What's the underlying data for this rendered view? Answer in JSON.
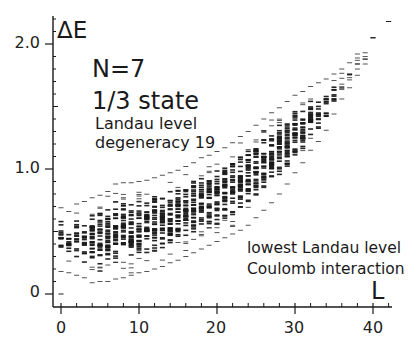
{
  "chart_data": {
    "type": "scatter",
    "title": "N=7 1/3 state",
    "subtitle": "Landau level degeneracy 19",
    "annotations": [
      "N=7",
      "1/3 state",
      "Landau level",
      "degeneracy 19",
      "lowest Landau level",
      "Coulomb interaction"
    ],
    "xlabel": "L",
    "ylabel": "ΔE",
    "xlim": [
      -1,
      42.5
    ],
    "ylim": [
      -0.1,
      2.2
    ],
    "x_ticks": [
      0,
      10,
      20,
      30,
      40
    ],
    "x_tick_labels": [
      "0",
      "10",
      "20",
      "30",
      "40"
    ],
    "y_ticks": [
      0,
      1.0,
      2.0
    ],
    "y_tick_labels": [
      "0",
      "1.0",
      "2.0"
    ],
    "y_minor_step": 0.1,
    "x_minor_step": 2,
    "grid": false,
    "legend": null,
    "marker": "short horizontal dash (energy level)",
    "series": [
      {
        "name": "energy spectrum envelope",
        "points": [
          {
            "L": 0,
            "ground": 0.0,
            "min": 0.18,
            "max": 0.69
          },
          {
            "L": 1,
            "min": 0.17,
            "max": 0.66
          },
          {
            "L": 2,
            "min": 0.15,
            "max": 0.72
          },
          {
            "L": 3,
            "min": 0.13,
            "max": 0.74
          },
          {
            "L": 4,
            "min": 0.09,
            "max": 0.77
          },
          {
            "L": 5,
            "min": 0.1,
            "max": 0.79
          },
          {
            "L": 6,
            "min": 0.1,
            "max": 0.82
          },
          {
            "L": 7,
            "min": 0.12,
            "max": 0.88
          },
          {
            "L": 8,
            "min": 0.13,
            "max": 0.89
          },
          {
            "L": 9,
            "min": 0.15,
            "max": 0.89
          },
          {
            "L": 10,
            "min": 0.17,
            "max": 0.9
          },
          {
            "L": 11,
            "min": 0.18,
            "max": 0.91
          },
          {
            "L": 12,
            "min": 0.2,
            "max": 0.93
          },
          {
            "L": 13,
            "min": 0.22,
            "max": 0.95
          },
          {
            "L": 14,
            "min": 0.25,
            "max": 0.97
          },
          {
            "L": 15,
            "min": 0.27,
            "max": 0.99
          },
          {
            "L": 16,
            "min": 0.3,
            "max": 1.02
          },
          {
            "L": 17,
            "min": 0.33,
            "max": 1.05
          },
          {
            "L": 18,
            "min": 0.36,
            "max": 1.09
          },
          {
            "L": 19,
            "min": 0.39,
            "max": 1.11
          },
          {
            "L": 20,
            "min": 0.42,
            "max": 1.14
          },
          {
            "L": 21,
            "min": 0.45,
            "max": 1.17
          },
          {
            "L": 22,
            "min": 0.48,
            "max": 1.21
          },
          {
            "L": 23,
            "min": 0.51,
            "max": 1.26
          },
          {
            "L": 24,
            "min": 0.55,
            "max": 1.3
          },
          {
            "L": 25,
            "min": 0.61,
            "max": 1.35
          },
          {
            "L": 26,
            "min": 0.67,
            "max": 1.4
          },
          {
            "L": 27,
            "min": 0.73,
            "max": 1.45
          },
          {
            "L": 28,
            "min": 0.8,
            "max": 1.49
          },
          {
            "L": 29,
            "min": 0.88,
            "max": 1.54
          },
          {
            "L": 30,
            "min": 0.97,
            "max": 1.59
          },
          {
            "L": 31,
            "min": 1.05,
            "max": 1.62
          },
          {
            "L": 32,
            "min": 1.15,
            "max": 1.66
          },
          {
            "L": 33,
            "min": 1.22,
            "max": 1.69
          },
          {
            "L": 34,
            "min": 1.31,
            "max": 1.72
          },
          {
            "L": 35,
            "min": 1.44,
            "max": 1.76
          },
          {
            "L": 36,
            "min": 1.56,
            "max": 1.8
          },
          {
            "L": 37,
            "min": 1.65,
            "max": 1.85
          },
          {
            "L": 38,
            "min": 1.75,
            "max": 1.92
          },
          {
            "L": 39,
            "min": 1.84,
            "max": 1.93
          },
          {
            "L": 40,
            "min": 2.05,
            "max": 2.05
          },
          {
            "L": 42,
            "min": 2.18,
            "max": 2.18
          }
        ]
      }
    ],
    "colors": {
      "ink": "#1a1a1a",
      "background": "#ffffff"
    }
  },
  "labels": {
    "ylabel": "ΔE",
    "xlabel": "L",
    "title_line1": "N=7",
    "title_line2": "1/3 state",
    "sub_line1": "Landau level",
    "sub_line2": "degeneracy 19",
    "note_line1": "lowest Landau level",
    "note_line2": "Coulomb interaction"
  },
  "axes": {
    "x_tick_labels": [
      "0",
      "10",
      "20",
      "30",
      "40"
    ],
    "y_tick_labels": [
      "0",
      "1.0",
      "2.0"
    ]
  }
}
